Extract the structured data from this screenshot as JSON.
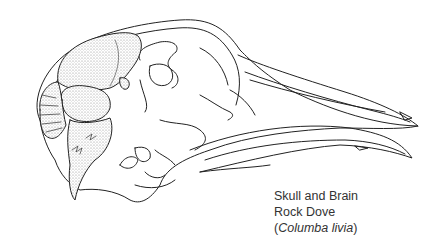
{
  "illustration": {
    "subject": "skull-and-brain-illustration",
    "ink_color": "#222222",
    "stipple_color": "#9a9a9a"
  },
  "caption": {
    "line1": "Skull and Brain",
    "line2": "Rock Dove",
    "line3_open": "(",
    "line3_italic": "Columba livia",
    "line3_close": ")"
  }
}
